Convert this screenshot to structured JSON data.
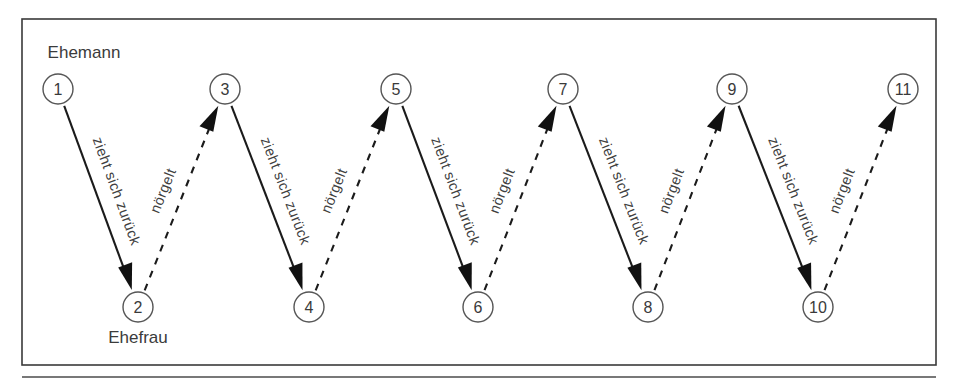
{
  "figure": {
    "frame": {
      "x": 22,
      "y": 19,
      "width": 914,
      "height": 346
    },
    "colors": {
      "background": "#ffffff",
      "frame_stroke": "#3a3a3a",
      "node_stroke": "#555555",
      "edge_solid": "#1b1b1b",
      "edge_dashed": "#1b1b1b",
      "text": "#3b3b3b"
    }
  },
  "roles": {
    "top_label": "Ehemann",
    "top_label_pos": {
      "x": 84,
      "y": 58
    },
    "bottom_label": "Ehefrau",
    "bottom_label_pos": {
      "x": 138,
      "y": 343
    }
  },
  "nodes": [
    {
      "id": 1,
      "label": "1",
      "x": 58,
      "y": 89,
      "row": "top"
    },
    {
      "id": 2,
      "label": "2",
      "x": 138,
      "y": 307,
      "row": "bottom"
    },
    {
      "id": 3,
      "label": "3",
      "x": 225,
      "y": 89,
      "row": "top"
    },
    {
      "id": 4,
      "label": "4",
      "x": 309,
      "y": 307,
      "row": "bottom"
    },
    {
      "id": 5,
      "label": "5",
      "x": 396,
      "y": 89,
      "row": "top"
    },
    {
      "id": 6,
      "label": "6",
      "x": 478,
      "y": 307,
      "row": "bottom"
    },
    {
      "id": 7,
      "label": "7",
      "x": 563,
      "y": 89,
      "row": "top"
    },
    {
      "id": 8,
      "label": "8",
      "x": 648,
      "y": 307,
      "row": "bottom"
    },
    {
      "id": 9,
      "label": "9",
      "x": 732,
      "y": 89,
      "row": "top"
    },
    {
      "id": 10,
      "label": "10",
      "x": 818,
      "y": 307,
      "row": "bottom"
    },
    {
      "id": 11,
      "label": "11",
      "x": 903,
      "y": 89,
      "row": "top"
    }
  ],
  "node_radius": 15,
  "edges": [
    {
      "from": 1,
      "to": 2,
      "style": "solid",
      "label": "zieht sich zurück",
      "direction": "down"
    },
    {
      "from": 2,
      "to": 3,
      "style": "dashed",
      "label": "nörgelt",
      "direction": "up"
    },
    {
      "from": 3,
      "to": 4,
      "style": "solid",
      "label": "zieht sich zurück",
      "direction": "down"
    },
    {
      "from": 4,
      "to": 5,
      "style": "dashed",
      "label": "nörgelt",
      "direction": "up"
    },
    {
      "from": 5,
      "to": 6,
      "style": "solid",
      "label": "zieht sich zurück",
      "direction": "down"
    },
    {
      "from": 6,
      "to": 7,
      "style": "dashed",
      "label": "nörgelt",
      "direction": "up"
    },
    {
      "from": 7,
      "to": 8,
      "style": "solid",
      "label": "zieht sich zurück",
      "direction": "down"
    },
    {
      "from": 8,
      "to": 9,
      "style": "dashed",
      "label": "nörgelt",
      "direction": "up"
    },
    {
      "from": 9,
      "to": 10,
      "style": "solid",
      "label": "zieht sich zurück",
      "direction": "down"
    },
    {
      "from": 10,
      "to": 11,
      "style": "dashed",
      "label": "nörgelt",
      "direction": "up"
    }
  ],
  "baseline_rule": {
    "x1": 22,
    "y1": 377,
    "x2": 936,
    "y2": 377
  }
}
